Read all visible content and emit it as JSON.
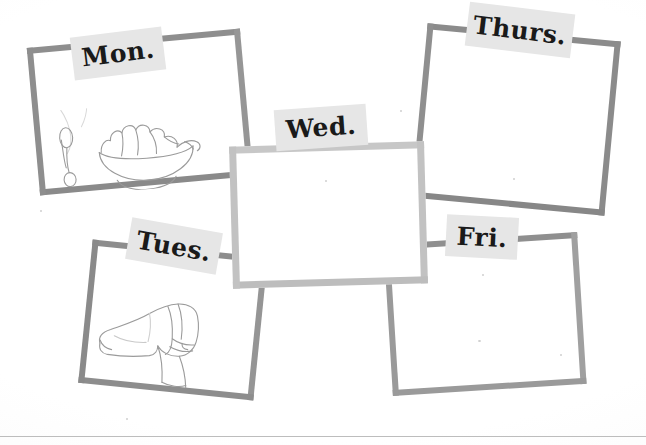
{
  "page": {
    "background_color": "#ffffff",
    "box_border_color": "#8c8c8c",
    "center_box_border_color": "#c2c2c2",
    "tag_background_color": "#e6e6e6",
    "tag_text_color": "#1a1a1a",
    "sketch_stroke_color": "#9b9b9b",
    "bottom_rule_color": "#bdbdbd"
  },
  "days": [
    {
      "id": "mon",
      "label": "Mon.",
      "content": "pencil sketch of a bowl of food with a spoon",
      "has_sketch": true
    },
    {
      "id": "tues",
      "label": "Tues.",
      "content": "pencil sketch of a shoe",
      "has_sketch": true
    },
    {
      "id": "wed",
      "label": "Wed.",
      "content": "",
      "has_sketch": false
    },
    {
      "id": "thurs",
      "label": "Thurs.",
      "content": "",
      "has_sketch": false
    },
    {
      "id": "fri",
      "label": "Fri.",
      "content": "",
      "has_sketch": false
    }
  ]
}
